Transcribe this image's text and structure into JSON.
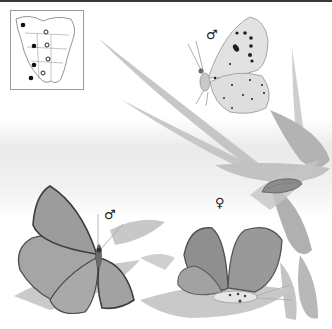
{
  "plate": {
    "subject": "butterfly illustration plate",
    "palette": {
      "ink": "#222222",
      "wing": "#9b9b9b",
      "wing_dark": "#6e6e6e",
      "leaf": "#b9b9b9",
      "background": "#ffffff"
    }
  },
  "range_map": {
    "region": "North America",
    "filled_dots": [
      [
        22,
        24
      ],
      [
        33,
        45
      ],
      [
        33,
        64
      ],
      [
        30,
        77
      ]
    ],
    "open_dots": [
      [
        45,
        31
      ],
      [
        46,
        44
      ],
      [
        47,
        58
      ],
      [
        42,
        72
      ]
    ]
  },
  "figures": [
    {
      "id": "top-male",
      "sex_symbol": "♂",
      "view": "underside",
      "symbol_pos": [
        206,
        28
      ]
    },
    {
      "id": "left-male",
      "sex_symbol": "♂",
      "view": "upperside",
      "symbol_pos": [
        104,
        208
      ]
    },
    {
      "id": "right-female",
      "sex_symbol": "♀",
      "view": "upperside",
      "symbol_pos": [
        215,
        196
      ]
    }
  ],
  "caterpillar": {
    "present": true
  }
}
